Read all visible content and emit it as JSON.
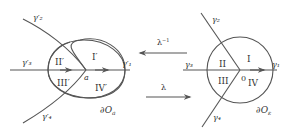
{
  "diagram": {
    "left": {
      "curves": {
        "gamma1": "γ′₁",
        "gamma2": "γ′₂",
        "gamma3": "γ′₃",
        "gamma4": "γ′₄"
      },
      "regions": [
        "I′",
        "II′",
        "III′",
        "IV′"
      ],
      "point_label": "a",
      "boundary_label": "∂O",
      "boundary_sub": "a"
    },
    "maps": {
      "inverse": "λ",
      "inverse_sup": "−1",
      "forward": "λ"
    },
    "right": {
      "curves": {
        "gamma1": "γ₁",
        "gamma2": "γ₂",
        "gamma3": "γ₃",
        "gamma4": "γ₄"
      },
      "regions": [
        "I",
        "II",
        "III",
        "IV"
      ],
      "point_label": "0",
      "boundary_label": "∂O",
      "boundary_sub": "ε"
    },
    "colors": {
      "line": "#555555",
      "text": "#333333",
      "background": "#ffffff"
    }
  }
}
